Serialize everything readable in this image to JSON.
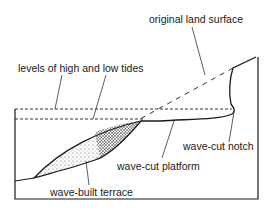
{
  "diagram": {
    "labels": {
      "original_land_surface": "original land surface",
      "tide_levels": "levels of high and low tides",
      "wave_cut_notch": "wave-cut notch",
      "wave_cut_platform": "wave-cut platform",
      "wave_built_terrace": "wave-built terrace"
    },
    "colors": {
      "line": "#1a1a1a",
      "background": "#ffffff"
    }
  }
}
